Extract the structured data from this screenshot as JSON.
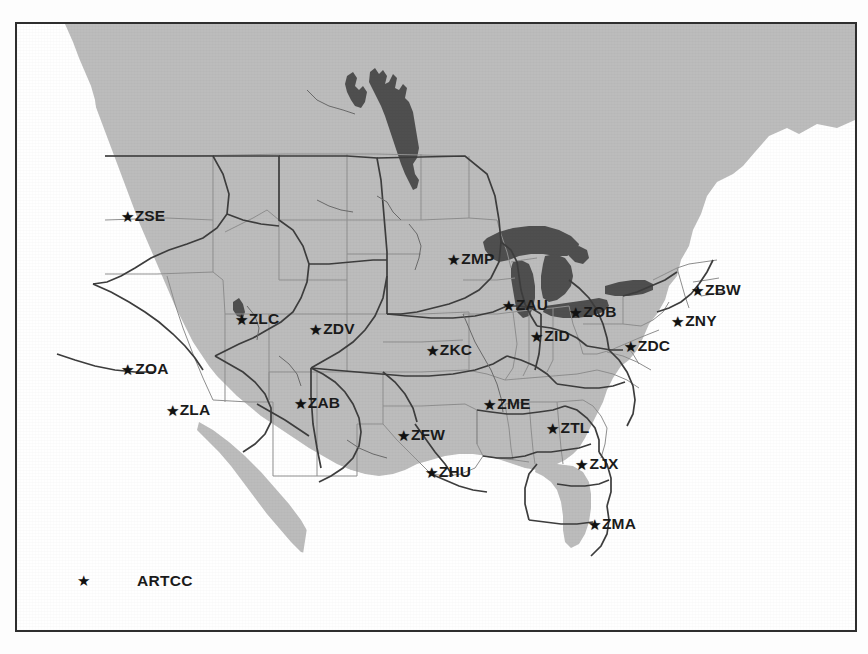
{
  "map": {
    "title": "ARTCC Map",
    "colors": {
      "land": "#bcbcbc",
      "water_dark": "#555555",
      "ocean": "#ffffff",
      "border": "#2e2e2e",
      "state_line": "#8a8a8a",
      "center_line": "#3a3a3a",
      "label": "#1b1b1b"
    },
    "legend": {
      "marker_icon": "star-icon",
      "marker_glyph": "★",
      "label": "ARTCC"
    },
    "artcc_centers": [
      {
        "code": "ZSE",
        "x": 118,
        "y": 192,
        "label_dx": 9
      },
      {
        "code": "ZLC",
        "x": 232,
        "y": 295,
        "label_dx": 9
      },
      {
        "code": "ZDV",
        "x": 307,
        "y": 305,
        "label_dx": 9
      },
      {
        "code": "ZOA",
        "x": 120,
        "y": 345,
        "label_dx": 9
      },
      {
        "code": "ZLA",
        "x": 163,
        "y": 386,
        "label_dx": 9
      },
      {
        "code": "ZAB",
        "x": 292,
        "y": 379,
        "label_dx": 9
      },
      {
        "code": "ZKC",
        "x": 424,
        "y": 326,
        "label_dx": 9
      },
      {
        "code": "ZMP",
        "x": 446,
        "y": 235,
        "label_dx": 9
      },
      {
        "code": "ZAU",
        "x": 500,
        "y": 281,
        "label_dx": 9
      },
      {
        "code": "ZID",
        "x": 525,
        "y": 312,
        "label_dx": 9
      },
      {
        "code": "ZOB",
        "x": 568,
        "y": 288,
        "label_dx": 9
      },
      {
        "code": "ZDC",
        "x": 622,
        "y": 322,
        "label_dx": 9
      },
      {
        "code": "ZBW",
        "x": 691,
        "y": 266,
        "label_dx": 9
      },
      {
        "code": "ZNY",
        "x": 669,
        "y": 297,
        "label_dx": 9
      },
      {
        "code": "ZME",
        "x": 482,
        "y": 380,
        "label_dx": 9
      },
      {
        "code": "ZFW",
        "x": 396,
        "y": 411,
        "label_dx": 9
      },
      {
        "code": "ZHU",
        "x": 423,
        "y": 448,
        "label_dx": 9
      },
      {
        "code": "ZTL",
        "x": 543,
        "y": 404,
        "label_dx": 9
      },
      {
        "code": "ZJX",
        "x": 572,
        "y": 440,
        "label_dx": 9
      },
      {
        "code": "ZMA",
        "x": 587,
        "y": 500,
        "label_dx": 9
      }
    ]
  }
}
